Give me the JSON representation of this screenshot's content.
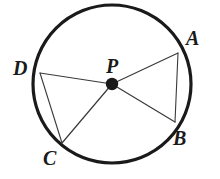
{
  "figure": {
    "kind": "circle-geometry-diagram",
    "background_color": "#ffffff",
    "stroke_color": "#1a1a1a",
    "line_color": "#3a3a3a",
    "label_color": "#1a1a1a",
    "circle_stroke_width": 3.2,
    "chord_stroke_width": 1.1,
    "radius_stroke_width": 1.2
  },
  "circle": {
    "center_x": 112,
    "center_y": 84,
    "radius": 79
  },
  "center_point": {
    "name": "P",
    "label": "P",
    "x": 112,
    "y": 84,
    "dot_radius": 6.2,
    "label_x": 106,
    "label_y": 56,
    "font_size": 20
  },
  "points": [
    {
      "name": "A",
      "label": "A",
      "x": 178,
      "y": 53,
      "label_x": 186,
      "label_y": 28,
      "font_size": 20
    },
    {
      "name": "B",
      "label": "B",
      "x": 175,
      "y": 122,
      "label_x": 173,
      "label_y": 128,
      "font_size": 20
    },
    {
      "name": "C",
      "label": "C",
      "x": 62,
      "y": 143,
      "label_x": 43,
      "label_y": 148,
      "font_size": 20
    },
    {
      "name": "D",
      "label": "D",
      "x": 40,
      "y": 73,
      "label_x": 13,
      "label_y": 58,
      "font_size": 20
    }
  ],
  "radii": [
    {
      "name": "radius-PA",
      "from": "P",
      "to": "A"
    },
    {
      "name": "radius-PB",
      "from": "P",
      "to": "B"
    },
    {
      "name": "radius-PC",
      "from": "P",
      "to": "C"
    },
    {
      "name": "radius-PD",
      "from": "P",
      "to": "D"
    }
  ],
  "chords": [
    {
      "name": "chord-AB",
      "from": "A",
      "to": "B"
    },
    {
      "name": "chord-DC",
      "from": "D",
      "to": "C"
    }
  ]
}
